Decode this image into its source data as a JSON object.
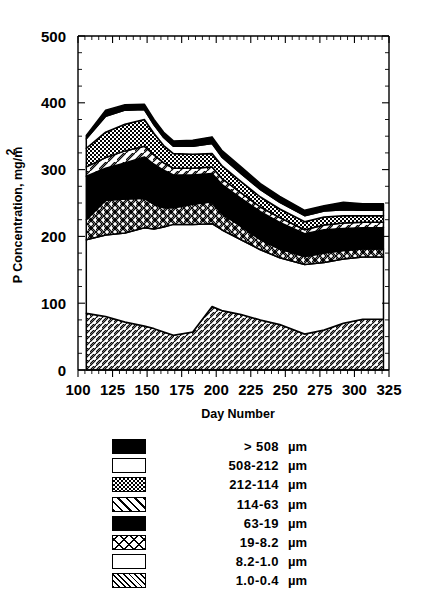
{
  "chart_data": {
    "type": "area",
    "stacked": true,
    "title": "",
    "xlabel": "Day Number",
    "ylabel": "P Concentration, mg/m²",
    "xlim": [
      100,
      325
    ],
    "ylim": [
      0,
      500
    ],
    "xticks": [
      100,
      125,
      150,
      175,
      200,
      225,
      250,
      275,
      300,
      325
    ],
    "yticks": [
      0,
      100,
      200,
      300,
      400,
      500
    ],
    "xtick_labels": [
      "100",
      "125",
      "150",
      "175",
      "200",
      "225",
      "250",
      "275",
      "300",
      "325"
    ],
    "ytick_labels": [
      "0",
      "100",
      "200",
      "300",
      "400",
      "500"
    ],
    "grid": false,
    "legend_position": "below",
    "x": [
      106,
      120,
      134,
      148,
      155,
      162,
      169,
      183,
      197,
      204,
      218,
      232,
      246,
      264,
      278,
      292,
      306,
      321
    ],
    "series": [
      {
        "name": "1.0-0.4 µm",
        "pattern": "diagonal-hatch-dense",
        "values": [
          85,
          80,
          72,
          66,
          62,
          57,
          52,
          57,
          95,
          89,
          83,
          75,
          68,
          54,
          60,
          70,
          76,
          76
        ]
      },
      {
        "name": "8.2-1.0 µm",
        "pattern": "white",
        "values": [
          110,
          122,
          133,
          147,
          149,
          157,
          166,
          161,
          124,
          121,
          112,
          105,
          100,
          104,
          101,
          96,
          93,
          93
        ]
      },
      {
        "name": "19-8.2 µm",
        "pattern": "diamond-crosshatch",
        "values": [
          30,
          52,
          51,
          44,
          37,
          29,
          25,
          30,
          33,
          24,
          20,
          15,
          13,
          12,
          14,
          13,
          12,
          12
        ]
      },
      {
        "name": "63-19 µm",
        "pattern": "solid-black",
        "values": [
          65,
          48,
          54,
          62,
          60,
          56,
          49,
          44,
          42,
          44,
          42,
          42,
          40,
          34,
          35,
          33,
          32,
          32
        ]
      },
      {
        "name": "114-63 µm",
        "pattern": "diagonal-stripes",
        "values": [
          14,
          16,
          18,
          16,
          14,
          11,
          10,
          10,
          10,
          9,
          8,
          7,
          7,
          6,
          7,
          8,
          8,
          8
        ]
      },
      {
        "name": "212-114 µm",
        "pattern": "fine-checker",
        "values": [
          28,
          38,
          40,
          40,
          32,
          26,
          22,
          21,
          20,
          19,
          17,
          15,
          13,
          12,
          12,
          11,
          10,
          10
        ]
      },
      {
        "name": "508-212 µm",
        "pattern": "white",
        "values": [
          14,
          24,
          21,
          15,
          13,
          12,
          11,
          12,
          15,
          13,
          12,
          11,
          10,
          9,
          9,
          9,
          8,
          8
        ]
      },
      {
        "name": "> 508 µm",
        "pattern": "solid-black",
        "values": [
          5,
          9,
          8,
          8,
          8,
          8,
          8,
          9,
          10,
          10,
          10,
          9,
          9,
          8,
          8,
          11,
          10,
          10
        ]
      }
    ]
  },
  "axes": {
    "ylabel": "P Concentration, mg/m",
    "ylabel_sup": "2",
    "xlabel": "Day Number"
  },
  "legend": {
    "items": [
      {
        "label": ">  508",
        "units": "µm",
        "pattern": "solid-black"
      },
      {
        "label": "508-212",
        "units": "µm",
        "pattern": "white"
      },
      {
        "label": "212-114",
        "units": "µm",
        "pattern": "fine-checker"
      },
      {
        "label": "114-63",
        "units": "µm",
        "pattern": "diagonal-stripes"
      },
      {
        "label": "63-19",
        "units": "µm",
        "pattern": "solid-black"
      },
      {
        "label": "19-8.2",
        "units": "µm",
        "pattern": "diamond-crosshatch"
      },
      {
        "label": "8.2-1.0",
        "units": "µm",
        "pattern": "white"
      },
      {
        "label": "1.0-0.4",
        "units": "µm",
        "pattern": "diagonal-hatch-dense"
      }
    ]
  },
  "colors": {
    "ink": "#000000",
    "paper": "#ffffff"
  }
}
